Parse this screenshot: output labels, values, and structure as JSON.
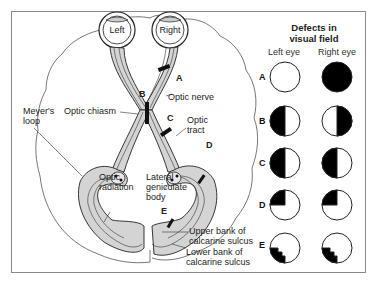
{
  "diagram": {
    "eyes": {
      "left": "Left",
      "right": "Right"
    },
    "lesion_markers": [
      "A",
      "B",
      "C",
      "D",
      "E"
    ],
    "labels": {
      "optic_nerve": "Optic nerve",
      "optic_chiasm": "Optic chiasm",
      "optic_tract": "Optic\ntract",
      "optic_tract_l1": "Optic",
      "optic_tract_l2": "tract",
      "meyers_loop_l1": "Meyer's",
      "meyers_loop_l2": "loop",
      "optic_radiation_l1": "Optic",
      "optic_radiation_l2": "radiation",
      "lgb_l1": "Lateral",
      "lgb_l2": "geniculate",
      "lgb_l3": "body",
      "upper_bank_l1": "Upper bank of",
      "upper_bank_l2": "calcarine sulcus",
      "lower_bank_l1": "Lower bank of",
      "lower_bank_l2": "calcarine sulcus"
    }
  },
  "visual_field_panel": {
    "title_l1": "Defects in",
    "title_l2": "visual field",
    "columns": [
      "Left eye",
      "Right eye"
    ],
    "rows": [
      {
        "label": "A",
        "left": "no defect",
        "right": "complete blindness"
      },
      {
        "label": "B",
        "left": "temporal (left) half blind",
        "right": "temporal (right) half blind"
      },
      {
        "label": "C",
        "left": "left half blind",
        "right": "left half blind"
      },
      {
        "label": "D",
        "left": "upper-left quadrant blind",
        "right": "upper-left quadrant blind"
      },
      {
        "label": "E",
        "left": "lower-left quadrant blind, macular sparing",
        "right": "lower-left quadrant blind, macular sparing"
      }
    ]
  },
  "colors": {
    "pathway_fill": "#d4d4d4",
    "outline": "#222222",
    "defect": "#000000",
    "frame": "#8a8a8a"
  }
}
